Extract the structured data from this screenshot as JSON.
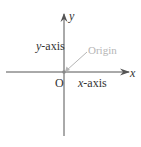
{
  "diagram": {
    "labels": {
      "y_var": "y",
      "x_var": "x",
      "y_axis": "-axis",
      "y_axis_prefix": "y",
      "x_axis": "-axis",
      "x_axis_prefix": "x",
      "origin_point": "O",
      "origin_callout": "Origin"
    },
    "colors": {
      "axis": "#555555",
      "callout": "#b5b5b5",
      "text": "#333333"
    }
  }
}
